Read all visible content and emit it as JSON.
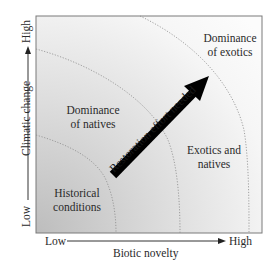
{
  "diagram": {
    "x_axis": {
      "title": "Biotic novelty",
      "low": "Low",
      "high": "High"
    },
    "y_axis": {
      "title": "Climatic change",
      "low": "Low",
      "high": "High"
    },
    "regions": [
      {
        "id": "historical",
        "label_line1": "Historical",
        "label_line2": "conditions"
      },
      {
        "id": "natives",
        "label_line1": "Dominance",
        "label_line2": "of natives"
      },
      {
        "id": "mixed",
        "label_line1": "Exotics and",
        "label_line2": "natives"
      },
      {
        "id": "exotics",
        "label_line1": "Dominance",
        "label_line2": "of exotics"
      }
    ],
    "arrow": {
      "label": "Restoration effort needed"
    },
    "colors": {
      "gradient_dark": "#bdbdbd",
      "gradient_light": "#fbfbfb",
      "frame": "#7a7a7a",
      "boundary": "#8a8a8a",
      "arrow": "#000000"
    }
  }
}
